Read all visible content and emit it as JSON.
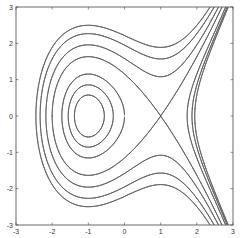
{
  "chart_data": {
    "type": "line",
    "subtype": "contour",
    "title": "",
    "xlabel": "",
    "ylabel": "",
    "xlim": [
      -3,
      3
    ],
    "ylim": [
      -3,
      3
    ],
    "xticks": [
      -3,
      -2,
      -1,
      0,
      1,
      2,
      3
    ],
    "yticks": [
      -3,
      -2,
      -1,
      0,
      1,
      2,
      3
    ],
    "xtick_labels": [
      "-3",
      "-2",
      "-1",
      "0",
      "1",
      "2",
      "3"
    ],
    "ytick_labels": [
      "-3",
      "-2",
      "-1",
      "0",
      "1",
      "2",
      "3"
    ],
    "grid": false,
    "legend": null,
    "function": "H(x,y) = y^2/2 + x - x^3/3",
    "levels": [
      -0.5,
      -0.3,
      0,
      0.6667,
      1.25,
      1.9,
      2.45
    ],
    "features": {
      "center": [
        -1,
        0
      ],
      "saddle": [
        1,
        0
      ]
    },
    "line_color": "#555555"
  },
  "plot": {
    "box": {
      "left": 16,
      "top": 7,
      "right": 233,
      "bottom": 225
    }
  }
}
